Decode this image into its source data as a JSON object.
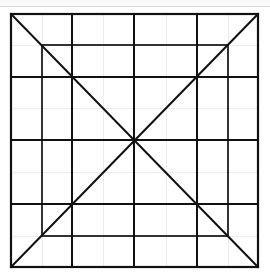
{
  "figure": {
    "colors": {
      "background": "#ffffff",
      "main_line": "#111111",
      "inner_square": "#333333",
      "faint_grid": "#ececec",
      "top_rule": "#d9d9d9"
    },
    "outer_square": {
      "x1": 11,
      "y1": 14,
      "x2": 258,
      "y2": 267
    },
    "inner_square": {
      "x1": 42,
      "y1": 45,
      "x2": 228,
      "y2": 236
    },
    "grid_vertical_x": [
      72,
      134,
      197
    ],
    "grid_horizontal_y": [
      77,
      140,
      204
    ],
    "faint_vertical_x": [
      42,
      103,
      166,
      228
    ],
    "faint_horizontal_y": [
      45,
      108,
      172,
      236
    ],
    "center": {
      "x": 134,
      "y": 140
    }
  }
}
